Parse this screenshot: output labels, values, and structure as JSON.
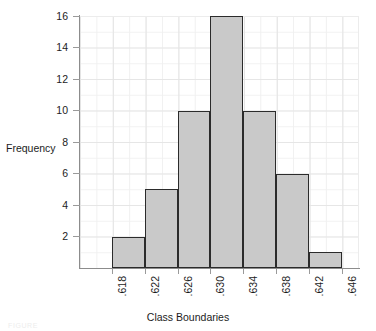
{
  "chart_data": {
    "type": "bar",
    "title": "",
    "subtitle": "",
    "xlabel": "Class Boundaries",
    "ylabel": "Frequency",
    "categories": [
      ".618-.622",
      ".622-.626",
      ".626-.630",
      ".630-.634",
      ".634-.638",
      ".638-.642",
      ".642-.646"
    ],
    "values": [
      2,
      5,
      10,
      16,
      10,
      6,
      1
    ],
    "bin_edges": [
      ".618",
      ".622",
      ".626",
      ".630",
      ".634",
      ".638",
      ".642",
      ".646"
    ],
    "x_tick_labels": [
      ".618",
      ".622",
      ".626",
      ".630",
      ".634",
      ".638",
      ".642",
      ".646"
    ],
    "x_tick_rotation": -90,
    "ylim": [
      0,
      16
    ],
    "y_tick_labels": [
      "2",
      "4",
      "6",
      "8",
      "10",
      "12",
      "14",
      "16"
    ],
    "y_tick_values": [
      2,
      4,
      6,
      8,
      10,
      12,
      14,
      16
    ],
    "y_tick_step": 2,
    "grid": true,
    "legend": false,
    "legend_position": "none",
    "bar_fill_color": "#c9c9c9",
    "bar_border_color": "#2b2b2b",
    "grid_color": "#ececec",
    "axis_color": "#8c8c8c",
    "text_color": "#1c1c1c"
  },
  "figure": {
    "caption": "FIGURE"
  }
}
